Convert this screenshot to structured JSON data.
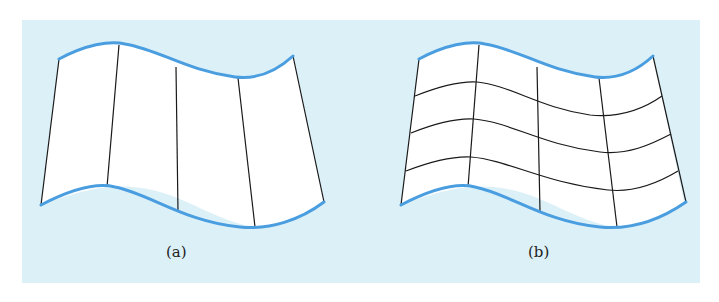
{
  "figure": {
    "background_color": "#dcf0f8",
    "edge_color": "#4a9ee0",
    "line_color": "#1a1a1a",
    "panels": [
      {
        "id": "a",
        "label": "(a)",
        "description": "Curved surface strip bounded by two wavy blue curves with five straight ruling lines (including boundary edges)",
        "grid_lines": 0
      },
      {
        "id": "b",
        "label": "(b)",
        "description": "Same curved surface with the ruling lines plus three wavy cross-curves forming a curvilinear grid",
        "grid_lines": 3
      }
    ]
  }
}
